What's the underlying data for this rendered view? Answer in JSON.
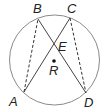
{
  "diagram": {
    "type": "circle-geometry",
    "circle": {
      "cx": 54.5,
      "cy": 60,
      "r": 45,
      "stroke": "#8a8a8a"
    },
    "points": {
      "A": {
        "x": 24,
        "y": 92,
        "label": "A",
        "lx": 9,
        "ly": 106
      },
      "B": {
        "x": 38,
        "y": 19,
        "label": "B",
        "lx": 33,
        "ly": 13
      },
      "C": {
        "x": 70,
        "y": 18,
        "label": "C",
        "lx": 67,
        "ly": 13
      },
      "D": {
        "x": 86,
        "y": 93,
        "label": "D",
        "lx": 84,
        "ly": 108
      },
      "E": {
        "label": "E",
        "lx": 57,
        "ly": 51
      },
      "R": {
        "x": 54,
        "y": 61,
        "label": "R",
        "lx": 49,
        "ly": 75
      }
    },
    "segments": [
      {
        "from": "A",
        "to": "B",
        "style": "dashed"
      },
      {
        "from": "C",
        "to": "D",
        "style": "dashed"
      },
      {
        "from": "A",
        "to": "C",
        "style": "solid"
      },
      {
        "from": "B",
        "to": "D",
        "style": "solid"
      }
    ]
  }
}
